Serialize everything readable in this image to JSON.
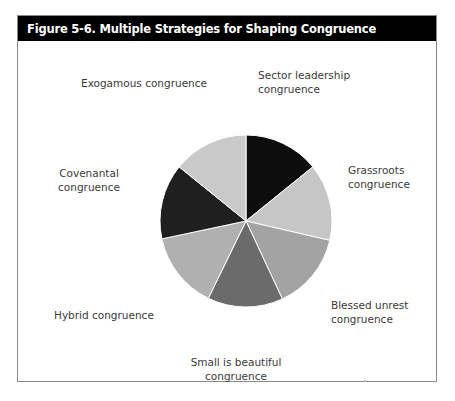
{
  "figure": {
    "title": "Figure 5-6. Multiple Strategies for Shaping Congruence",
    "title_bar_color": "#000000",
    "title_text_color": "#ffffff",
    "border_color": "#8a8a8a",
    "background_color": "#ffffff"
  },
  "chart_data": {
    "type": "pie",
    "title": "Figure 5-6. Multiple Strategies for Shaping Congruence",
    "xlabel": "",
    "ylabel": "",
    "legend_position": "none",
    "grid": false,
    "start_angle_deg": 0,
    "direction": "clockwise",
    "center": {
      "x": 228,
      "y": 205
    },
    "radius": 86,
    "label_color": "#3a3a3a",
    "slice_separator_color": "#ffffff",
    "categories": [
      "Sector leadership congruence",
      "Grassroots congruence",
      "Blessed unrest congruence",
      "Small is beautiful congruence",
      "Hybrid congruence",
      "Covenantal congruence",
      "Exogamous congruence"
    ],
    "values": [
      14.3,
      14.3,
      14.3,
      14.3,
      14.3,
      14.3,
      14.3
    ],
    "colors": [
      "#0d0d0d",
      "#c6c6c6",
      "#a3a3a3",
      "#6b6b6b",
      "#b0b0b0",
      "#1f1f1f",
      "#c9c9c9"
    ],
    "slices": [
      {
        "name": "Sector leadership congruence",
        "label_line_1": "Sector leadership",
        "label_line_2": "congruence",
        "value": 14.3,
        "start_deg": 0,
        "end_deg": 51,
        "color": "#0d0d0d"
      },
      {
        "name": "Grassroots congruence",
        "label_line_1": "Grassroots",
        "label_line_2": "congruence",
        "value": 14.3,
        "start_deg": 51,
        "end_deg": 103,
        "color": "#c6c6c6"
      },
      {
        "name": "Blessed unrest congruence",
        "label_line_1": "Blessed unrest",
        "label_line_2": "congruence",
        "value": 14.3,
        "start_deg": 103,
        "end_deg": 155,
        "color": "#a3a3a3"
      },
      {
        "name": "Small is beautiful congruence",
        "label_line_1": "Small is beautiful",
        "label_line_2": "congruence",
        "value": 14.3,
        "start_deg": 155,
        "end_deg": 206,
        "color": "#6b6b6b"
      },
      {
        "name": "Hybrid congruence",
        "label_line_1": "Hybrid congruence",
        "label_line_2": "",
        "value": 14.3,
        "start_deg": 206,
        "end_deg": 258,
        "color": "#b0b0b0"
      },
      {
        "name": "Covenantal congruence",
        "label_line_1": "Covenantal",
        "label_line_2": "congruence",
        "value": 14.3,
        "start_deg": 258,
        "end_deg": 309,
        "color": "#1f1f1f"
      },
      {
        "name": "Exogamous congruence",
        "label_line_1": "Exogamous congruence",
        "label_line_2": "",
        "value": 14.3,
        "start_deg": 309,
        "end_deg": 360,
        "color": "#c9c9c9"
      }
    ]
  }
}
